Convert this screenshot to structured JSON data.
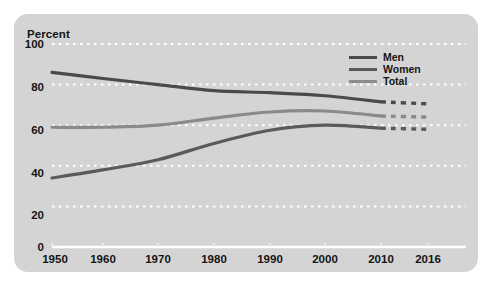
{
  "chart_data": {
    "type": "line",
    "title": "",
    "ylabel": "Percent",
    "xlabel": "",
    "ylim": [
      0,
      100
    ],
    "yticks": [
      0,
      20,
      40,
      60,
      80,
      100
    ],
    "categories": [
      "1950",
      "1960",
      "1970",
      "1980",
      "1990",
      "2000",
      "2010",
      "2016"
    ],
    "grid": "horizontal-dotted-white",
    "legend_position": "top-right",
    "projection_note": "2010 to 2016 segment rendered dashed",
    "series": [
      {
        "name": "Men",
        "color": "#4a4a4a",
        "values": [
          86,
          83,
          80,
          77,
          76,
          74.5,
          71.5,
          70.5
        ]
      },
      {
        "name": "Women",
        "color": "#5a5a5a",
        "values": [
          34,
          38,
          43,
          51,
          57.5,
          60,
          58.5,
          58
        ]
      },
      {
        "name": "Total",
        "color": "#8a8a8a",
        "values": [
          59,
          59,
          60,
          63.5,
          66.5,
          67,
          64.5,
          64
        ]
      }
    ]
  },
  "axis": {
    "y_title": "Percent",
    "y_ticks": [
      "100",
      "80",
      "60",
      "40",
      "20",
      "0"
    ],
    "x_ticks": [
      "1950",
      "1960",
      "1970",
      "1980",
      "1990",
      "2000",
      "2010",
      "2016"
    ]
  },
  "legend": {
    "items": [
      {
        "label": "Men",
        "color": "#4a4a4a"
      },
      {
        "label": "Women",
        "color": "#5a5a5a"
      },
      {
        "label": "Total",
        "color": "#8a8a8a"
      }
    ]
  },
  "colors": {
    "panel_background": "#d4d4d4",
    "page_background": "#ffffff",
    "gridline": "#ffffff",
    "axis_line": "#ffffff",
    "text": "#141414"
  }
}
